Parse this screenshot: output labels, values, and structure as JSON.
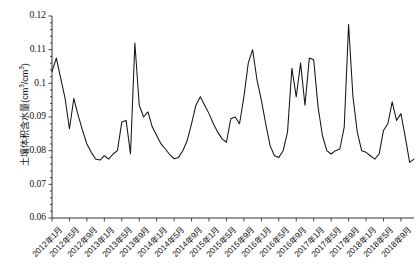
{
  "chart_data": {
    "type": "line",
    "title": "",
    "xlabel": "",
    "ylabel": "土壤体积含水量(cm3/cm3)",
    "ylabel_parts": {
      "prefix": "土壤体积含水量(cm",
      "sup1": "3",
      "middle": "/cm",
      "sup2": "3",
      "suffix": ")"
    },
    "ylim": [
      0.06,
      0.12
    ],
    "yticks": [
      0.06,
      0.07,
      0.08,
      0.09,
      0.1,
      0.11,
      0.12
    ],
    "ytick_labels": [
      "0.06",
      "0.07",
      "0.08",
      "0.09",
      "0.1",
      "0.11",
      "0.12"
    ],
    "y_minor_ticks": true,
    "grid": false,
    "legend": null,
    "x_start": "2012年1月",
    "x_end": "2018年12月",
    "xtick_labels": [
      "2012年1月",
      "2012年5月",
      "2012年9月",
      "2013年1月",
      "2013年5月",
      "2013年9月",
      "2014年1月",
      "2014年5月",
      "2014年9月",
      "2015年1月",
      "2015年5月",
      "2015年9月",
      "2016年1月",
      "2016年5月",
      "2016年9月",
      "2017年1月",
      "2017年5月",
      "2017年9月",
      "2018年1月",
      "2018年5月",
      "2018年9月"
    ],
    "xtick_indices": [
      0,
      4,
      8,
      12,
      16,
      20,
      24,
      28,
      32,
      36,
      40,
      44,
      48,
      52,
      56,
      60,
      64,
      68,
      72,
      76,
      80
    ],
    "series": [
      {
        "name": "土壤体积含水量",
        "color": "#141414",
        "x": [
          "2012年1月",
          "2012年2月",
          "2012年3月",
          "2012年4月",
          "2012年5月",
          "2012年6月",
          "2012年7月",
          "2012年8月",
          "2012年9月",
          "2012年10月",
          "2012年11月",
          "2012年12月",
          "2013年1月",
          "2013年2月",
          "2013年3月",
          "2013年4月",
          "2013年5月",
          "2013年6月",
          "2013年7月",
          "2013年8月",
          "2013年9月",
          "2013年10月",
          "2013年11月",
          "2013年12月",
          "2014年1月",
          "2014年2月",
          "2014年3月",
          "2014年4月",
          "2014年5月",
          "2014年6月",
          "2014年7月",
          "2014年8月",
          "2014年9月",
          "2014年10月",
          "2014年11月",
          "2014年12月",
          "2015年1月",
          "2015年2月",
          "2015年3月",
          "2015年4月",
          "2015年5月",
          "2015年6月",
          "2015年7月",
          "2015年8月",
          "2015年9月",
          "2015年10月",
          "2015年11月",
          "2015年12月",
          "2016年1月",
          "2016年2月",
          "2016年3月",
          "2016年4月",
          "2016年5月",
          "2016年6月",
          "2016年7月",
          "2016年8月",
          "2016年9月",
          "2016年10月",
          "2016年11月",
          "2016年12月",
          "2017年1月",
          "2017年2月",
          "2017年3月",
          "2017年4月",
          "2017年5月",
          "2017年6月",
          "2017年7月",
          "2017年8月",
          "2017年9月",
          "2017年10月",
          "2017年11月",
          "2017年12月",
          "2018年1月",
          "2018年2月",
          "2018年3月",
          "2018年4月",
          "2018年5月",
          "2018年6月",
          "2018年7月",
          "2018年8月",
          "2018年9月",
          "2018年10月",
          "2018年11月",
          "2018年12月"
        ],
        "values": [
          0.1035,
          0.1075,
          0.1015,
          0.0955,
          0.0865,
          0.0955,
          0.0905,
          0.086,
          0.082,
          0.0795,
          0.0775,
          0.0772,
          0.0785,
          0.0775,
          0.079,
          0.08,
          0.0885,
          0.089,
          0.079,
          0.112,
          0.0935,
          0.09,
          0.0915,
          0.087,
          0.0845,
          0.082,
          0.0805,
          0.0788,
          0.0776,
          0.078,
          0.08,
          0.083,
          0.088,
          0.0935,
          0.096,
          0.0935,
          0.091,
          0.088,
          0.0855,
          0.0835,
          0.0825,
          0.0895,
          0.09,
          0.088,
          0.096,
          0.106,
          0.11,
          0.101,
          0.095,
          0.088,
          0.0815,
          0.0785,
          0.078,
          0.08,
          0.0855,
          0.1045,
          0.096,
          0.106,
          0.0935,
          0.1075,
          0.107,
          0.093,
          0.0845,
          0.08,
          0.079,
          0.08,
          0.0805,
          0.087,
          0.1175,
          0.096,
          0.0855,
          0.08,
          0.0795,
          0.0785,
          0.0775,
          0.079,
          0.086,
          0.088,
          0.0945,
          0.089,
          0.091,
          0.084,
          0.0765,
          0.0775
        ]
      }
    ]
  }
}
